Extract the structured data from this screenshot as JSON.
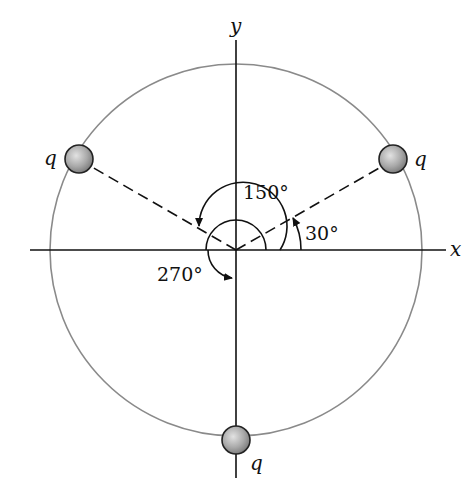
{
  "diagram": {
    "axes": {
      "x_label": "x",
      "y_label": "y"
    },
    "charges": [
      {
        "label": "q",
        "angle_deg": 150,
        "position": "upper-left"
      },
      {
        "label": "q",
        "angle_deg": 30,
        "position": "upper-right"
      },
      {
        "label": "q",
        "angle_deg": 270,
        "position": "bottom"
      }
    ],
    "angle_labels": {
      "a30": "30°",
      "a150": "150°",
      "a270": "270°"
    },
    "colors": {
      "circle": "#8a8a8a",
      "lines": "#111111",
      "charge_fill": "#a8a8a8"
    }
  }
}
